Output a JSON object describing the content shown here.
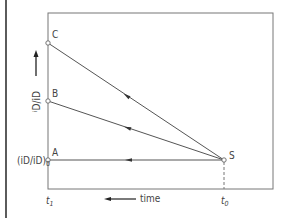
{
  "diagram": {
    "points": {
      "C": {
        "label": "C"
      },
      "B": {
        "label": "B"
      },
      "A": {
        "label": "A"
      },
      "S": {
        "label": "S"
      }
    },
    "y_axis": {
      "label_main": "i",
      "label_sub": "D",
      "label_slash": "/i",
      "label_sub2": "D",
      "a_label": "(i",
      "a_label_sub": "D",
      "a_label_mid": "/i",
      "a_label_sub2": "D",
      "a_label_end": ")",
      "a_label_sub0": "0"
    },
    "x_axis": {
      "t1": "t",
      "t1_sub": "1",
      "t0": "t",
      "t0_sub": "0",
      "time_label": "time"
    },
    "colors": {
      "line": "#555555",
      "frame": "#777777"
    }
  }
}
